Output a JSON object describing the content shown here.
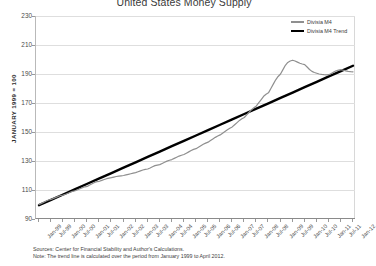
{
  "chart_data": {
    "type": "line",
    "title": "United States Money Supply",
    "xlabel": "",
    "ylabel": "JANUARY 1999 = 100",
    "ylim": [
      90,
      230
    ],
    "yticks": [
      90,
      110,
      130,
      150,
      170,
      190,
      210,
      230
    ],
    "grid": true,
    "legend_position": "top-right",
    "x": [
      "Jan-99",
      "Jul-99",
      "Jan-00",
      "Jul-00",
      "Jan-01",
      "Jul-01",
      "Jan-02",
      "Jul-02",
      "Jan-03",
      "Jul-03",
      "Jan-04",
      "Jul-04",
      "Jan-05",
      "Jul-05",
      "Jan-06",
      "Jul-06",
      "Jan-07",
      "Jul-07",
      "Jan-08",
      "Jul-08",
      "Jan-09",
      "Jul-09",
      "Jan-10",
      "Jul-10",
      "Jan-11",
      "Jul-11",
      "Jan-12"
    ],
    "xtick_labels": [
      "Jan-99",
      "Jul-99",
      "Jan-00",
      "Jul-00",
      "Jan-01",
      "Jul-01",
      "Jan-02",
      "Jul-02",
      "Jan-03",
      "Jul-03",
      "Jan-04",
      "Jul-04",
      "Jan-05",
      "Jul-05",
      "Jan-06",
      "Jul-06",
      "Jan-07",
      "Jul-07",
      "Jan-08",
      "Jul-08",
      "Jan-09",
      "Jul-09",
      "Jan-10",
      "Jul-10",
      "Jan-11",
      "Jul-11",
      "Jan-12"
    ],
    "series": [
      {
        "name": "Divisia M4",
        "color": "#8f8f8f",
        "width": 1.2,
        "values": [
          100.0,
          103.5,
          106.5,
          109.5,
          112.5,
          116.0,
          118.5,
          120.0,
          122.0,
          124.5,
          127.5,
          131.0,
          134.5,
          138.5,
          143.0,
          148.0,
          153.5,
          160.0,
          168.0,
          177.0,
          190.0,
          199.5,
          196.5,
          190.5,
          189.5,
          193.0,
          191.5
        ]
      },
      {
        "name": "Divisia M4 Trend",
        "color": "#000000",
        "width": 2.4,
        "values": [
          99.5,
          103.2,
          106.9,
          110.6,
          114.3,
          118.0,
          121.7,
          125.4,
          129.1,
          132.8,
          136.5,
          140.2,
          143.9,
          147.6,
          151.3,
          155.0,
          158.7,
          162.4,
          166.1,
          169.8,
          173.5,
          177.2,
          180.9,
          184.6,
          188.3,
          192.0,
          195.7
        ]
      }
    ],
    "series_detail": {
      "Divisia M4": [
        100.0,
        100.8,
        101.6,
        102.4,
        103.1,
        103.5,
        104.2,
        104.9,
        105.6,
        106.2,
        106.5,
        107.1,
        107.8,
        108.5,
        109.1,
        109.5,
        110.2,
        110.9,
        111.6,
        112.2,
        112.5,
        113.4,
        114.3,
        115.2,
        115.8,
        116.0,
        116.6,
        117.2,
        117.8,
        118.2,
        118.5,
        118.9,
        119.3,
        119.6,
        119.8,
        120.0,
        120.4,
        120.8,
        121.2,
        121.6,
        122.0,
        122.6,
        123.2,
        123.8,
        124.2,
        124.5,
        125.2,
        126.0,
        126.8,
        127.2,
        127.5,
        128.3,
        129.1,
        129.9,
        130.5,
        131.0,
        131.8,
        132.6,
        133.4,
        134.0,
        134.5,
        135.4,
        136.3,
        137.2,
        138.0,
        138.5,
        139.5,
        140.5,
        141.5,
        142.3,
        143.0,
        144.1,
        145.2,
        146.3,
        147.2,
        148.0,
        149.2,
        150.4,
        151.6,
        152.6,
        153.5,
        155.0,
        156.5,
        158.0,
        159.1,
        160.0,
        161.8,
        163.6,
        165.4,
        166.8,
        168.0,
        170.2,
        172.4,
        174.6,
        176.0,
        177.0,
        180.0,
        183.0,
        186.0,
        188.3,
        190.0,
        193.0,
        196.0,
        198.0,
        199.0,
        199.5,
        199.0,
        198.2,
        197.4,
        196.9,
        196.5,
        194.8,
        193.1,
        191.8,
        191.0,
        190.5,
        190.0,
        189.7,
        189.5,
        189.4,
        189.5,
        190.4,
        191.3,
        192.2,
        192.7,
        193.0,
        192.6,
        192.2,
        191.8,
        191.6,
        191.5
      ]
    },
    "annotations": []
  },
  "legend": {
    "items": [
      {
        "label": "Divisia M4",
        "style": "series"
      },
      {
        "label": "Divisia M4 Trend",
        "style": "trend"
      }
    ]
  },
  "footnotes": [
    "Sources: Center for Financial Stability and Author's Calculations.",
    "Note: The trend line is calculated over the period from January 1999 to April 2012."
  ]
}
